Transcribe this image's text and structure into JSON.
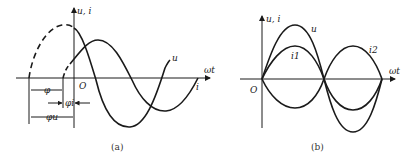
{
  "figure_a": {
    "axis_y_label": "u, i",
    "axis_x_label": "ωt",
    "origin_label": "O",
    "curve_u_label": "u",
    "curve_i_label": "i",
    "phi_label": "φ",
    "phi_i_label": "φi",
    "phi_u_label": "φu",
    "caption": "(a)"
  },
  "figure_b": {
    "axis_y_label": "u, i",
    "axis_x_label": "ωt",
    "origin_label": "O",
    "curve_u_label": "u",
    "curve_i1_label": "i1",
    "curve_i2_label": "i2",
    "caption": "(b)"
  }
}
